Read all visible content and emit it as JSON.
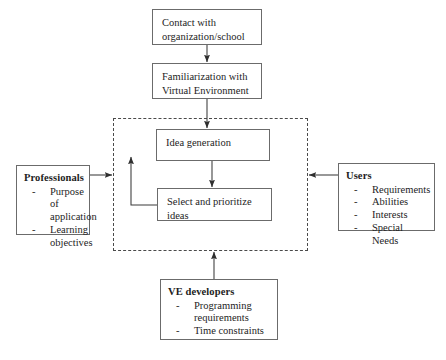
{
  "diagram": {
    "type": "flowchart",
    "colors": {
      "box_border": "#6b6b6b",
      "group_border": "#4a4a4a",
      "line": "#3a3a3a",
      "background": "#ffffff",
      "text": "#1d1d1d"
    },
    "nodes": {
      "contact": {
        "id": "contact",
        "label": "Contact with\norganization/school",
        "shape": "rectangle",
        "style": "process"
      },
      "familiarization": {
        "id": "familiarization",
        "label": "Familiarization with\nVirtual Environment",
        "shape": "rectangle",
        "style": "process"
      },
      "idea_generation": {
        "id": "idea_generation",
        "label": "Idea generation",
        "shape": "rectangle",
        "style": "process"
      },
      "select_prioritize": {
        "id": "select_prioritize",
        "label": "Select and prioritize\nideas",
        "shape": "rectangle",
        "style": "process"
      },
      "professionals": {
        "id": "professionals",
        "heading": "Professionals",
        "items": [
          "Purpose of application",
          "Learning objectives"
        ],
        "bullet": "-",
        "shape": "rectangle",
        "style": "actor"
      },
      "users": {
        "id": "users",
        "heading": "Users",
        "items": [
          "Requirements",
          "Abilities",
          "Interests",
          "Special Needs"
        ],
        "bullet": "-",
        "shape": "rectangle",
        "style": "actor"
      },
      "ve_developers": {
        "id": "ve_developers",
        "heading": "VE developers",
        "items": [
          "Programming requirements",
          "Time constraints"
        ],
        "bullet": "-",
        "shape": "rectangle",
        "style": "actor"
      }
    },
    "group_region": {
      "id": "brainstorming-region",
      "label": "",
      "border_style": "dashed"
    },
    "edges": [
      {
        "from": "contact",
        "to": "familiarization",
        "arrow": "down",
        "style": "solid"
      },
      {
        "from": "familiarization",
        "to": "idea_generation",
        "arrow": "down",
        "style": "solid"
      },
      {
        "from": "idea_generation",
        "to": "select_prioritize",
        "arrow": "down",
        "style": "solid"
      },
      {
        "from": "select_prioritize",
        "to": "idea_generation",
        "arrow": "up",
        "style": "solid",
        "note": "feedback loop"
      },
      {
        "from": "professionals",
        "to": "group_region",
        "arrow": "right",
        "style": "solid"
      },
      {
        "from": "users",
        "to": "group_region",
        "arrow": "left",
        "style": "solid"
      },
      {
        "from": "ve_developers",
        "to": "group_region",
        "arrow": "up",
        "style": "solid"
      }
    ]
  }
}
